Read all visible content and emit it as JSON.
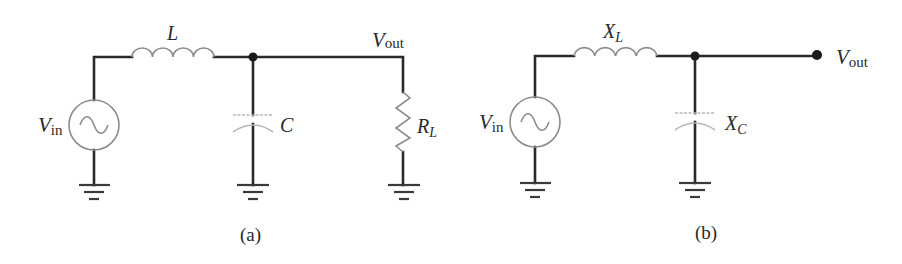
{
  "figure": {
    "panels": [
      {
        "id": "a",
        "caption": "(a)",
        "components": {
          "source": {
            "main": "V",
            "sub": "in"
          },
          "inductor": {
            "main": "L",
            "sub": ""
          },
          "capacitor": {
            "main": "C",
            "sub": ""
          },
          "load": {
            "main": "R",
            "sub": "L"
          },
          "output": {
            "main": "V",
            "sub": "out"
          }
        }
      },
      {
        "id": "b",
        "caption": "(b)",
        "components": {
          "source": {
            "main": "V",
            "sub": "in"
          },
          "inductor": {
            "main": "X",
            "sub": "L"
          },
          "capacitor": {
            "main": "X",
            "sub": "C"
          },
          "output": {
            "main": "V",
            "sub": "out"
          }
        }
      }
    ],
    "colors": {
      "wire": "#2a2a2a",
      "component": "#8c8c8c",
      "capacitor": "#b8b8b8",
      "background": "#ffffff"
    }
  }
}
